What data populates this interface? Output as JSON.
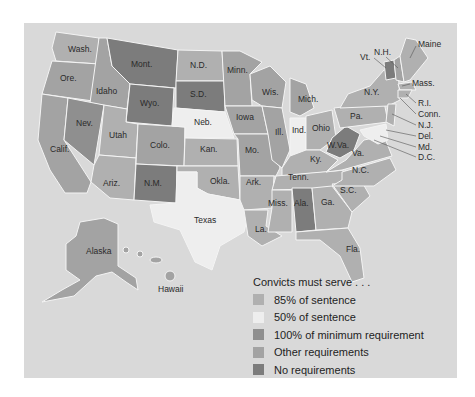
{
  "colors": {
    "background": "#d9d9d9",
    "85pct": "#b0b0b0",
    "50pct": "#eeeeee",
    "100pct_min": "#8f8f8f",
    "other": "#a3a3a3",
    "none": "#7c7c7c"
  },
  "legend": {
    "title": "Convicts must serve . . .",
    "items": [
      {
        "label": "85% of sentence",
        "color": "#b0b0b0"
      },
      {
        "label": "50% of sentence",
        "color": "#eeeeee"
      },
      {
        "label": "100% of minimum requirement",
        "color": "#8f8f8f"
      },
      {
        "label": "Other requirements",
        "color": "#a3a3a3"
      },
      {
        "label": "No requirements",
        "color": "#7c7c7c"
      }
    ]
  },
  "states": {
    "wash": "Wash.",
    "ore": "Ore.",
    "calif": "Calif.",
    "idaho": "Idaho",
    "nev": "Nev.",
    "mont": "Mont.",
    "wyo": "Wyo.",
    "utah": "Utah",
    "ariz": "Ariz.",
    "colo": "Colo.",
    "nm": "N.M.",
    "nd": "N.D.",
    "sd": "S.D.",
    "neb": "Neb.",
    "kan": "Kan.",
    "okla": "Okla.",
    "texas": "Texas",
    "minn": "Minn.",
    "iowa": "Iowa",
    "mo": "Mo.",
    "ark": "Ark.",
    "la": "La.",
    "wis": "Wis.",
    "ill": "Ill.",
    "mich": "Mich.",
    "ind": "Ind.",
    "ohio": "Ohio",
    "ky": "Ky.",
    "tenn": "Tenn.",
    "miss": "Miss.",
    "ala": "Ala.",
    "ga": "Ga.",
    "fla": "Fla.",
    "sc": "S.C.",
    "nc": "N.C.",
    "va": "Va.",
    "wva": "W.Va.",
    "pa": "Pa.",
    "ny": "N.Y.",
    "vt": "Vt.",
    "nh": "N.H.",
    "maine": "Maine",
    "mass": "Mass.",
    "ri": "R.I.",
    "conn": "Conn.",
    "nj": "N.J.",
    "del": "Del.",
    "md": "Md.",
    "dc": "D.C.",
    "alaska": "Alaska",
    "hawaii": "Hawaii"
  }
}
